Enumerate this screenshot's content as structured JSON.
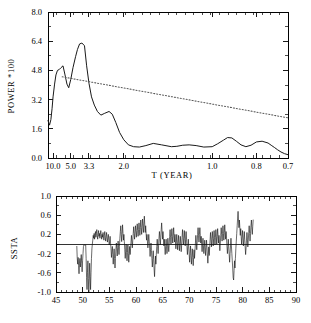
{
  "figure": {
    "caption_top_panel": "POWER *100",
    "caption_bottom_panel": "SSTA"
  },
  "chart_data": [
    {
      "type": "line",
      "title": "",
      "panel": "top",
      "xlabel": "T (YEAR)",
      "ylabel": "POWER *100",
      "xscale": "reciprocal-period",
      "xlim": [
        14.0,
        0.7
      ],
      "ylim": [
        0.0,
        8.0
      ],
      "grid": false,
      "legend": false,
      "xtick_labels": [
        "10.0",
        "5.0",
        "3.3",
        "2.0",
        "1.0",
        "0.8",
        "0.7"
      ],
      "xtick_values": [
        10.0,
        5.0,
        3.3,
        2.0,
        1.0,
        0.8,
        0.7
      ],
      "ytick_labels": [
        "0.0",
        "1.6",
        "3.2",
        "4.8",
        "6.4",
        "8.0"
      ],
      "ytick_values": [
        0.0,
        1.6,
        3.2,
        4.8,
        6.4,
        8.0
      ],
      "series": [
        {
          "name": "power spectrum",
          "style": "solid",
          "x": [
            14.0,
            12.5,
            11.4,
            10.6,
            10.0,
            9.2,
            8.6,
            8.0,
            7.4,
            6.9,
            6.4,
            6.0,
            5.6,
            5.3,
            5.0,
            4.7,
            4.4,
            4.2,
            4.0,
            3.8,
            3.6,
            3.45,
            3.3,
            3.15,
            3.0,
            2.85,
            2.7,
            2.55,
            2.4,
            2.3,
            2.2,
            2.1,
            2.0,
            1.9,
            1.8,
            1.7,
            1.6,
            1.5,
            1.4,
            1.3,
            1.25,
            1.2,
            1.15,
            1.1,
            1.05,
            1.0,
            0.97,
            0.94,
            0.92,
            0.9,
            0.88,
            0.86,
            0.84,
            0.82,
            0.8,
            0.78,
            0.76,
            0.75,
            0.74,
            0.73,
            0.72,
            0.71,
            0.7
          ],
          "y": [
            2.05,
            1.8,
            2.1,
            2.7,
            3.35,
            4.05,
            4.55,
            4.8,
            4.85,
            4.95,
            5.05,
            4.6,
            4.05,
            3.85,
            4.3,
            4.95,
            5.55,
            5.95,
            6.25,
            6.3,
            6.15,
            5.05,
            4.1,
            3.35,
            2.9,
            2.55,
            2.35,
            2.45,
            2.55,
            2.4,
            1.95,
            1.4,
            1.0,
            0.72,
            0.62,
            0.6,
            0.68,
            0.8,
            0.72,
            0.62,
            0.64,
            0.7,
            0.72,
            0.68,
            0.6,
            0.62,
            0.78,
            0.98,
            1.12,
            1.1,
            0.92,
            0.72,
            0.62,
            0.7,
            0.88,
            0.92,
            0.82,
            0.7,
            0.58,
            0.45,
            0.33,
            0.24,
            0.18
          ]
        },
        {
          "name": "red noise confidence level",
          "style": "dotted",
          "x": [
            6.6,
            0.7
          ],
          "y": [
            4.45,
            2.2
          ]
        }
      ]
    },
    {
      "type": "line",
      "title": "",
      "panel": "bottom",
      "xlabel": "",
      "ylabel": "SSTA",
      "xlim": [
        45,
        90
      ],
      "ylim": [
        -1.0,
        1.0
      ],
      "grid": false,
      "legend": false,
      "zero_reference_line": 0.0,
      "xtick_labels": [
        "45",
        "50",
        "55",
        "60",
        "65",
        "70",
        "75",
        "80",
        "85",
        "90"
      ],
      "xtick_values": [
        45,
        50,
        55,
        60,
        65,
        70,
        75,
        80,
        85,
        90
      ],
      "ytick_labels": [
        "-1.0",
        "-0.6",
        "-0.2",
        "0.2",
        "0.6",
        "1.0"
      ],
      "ytick_values": [
        -1.0,
        -0.6,
        -0.2,
        0.2,
        0.6,
        1.0
      ],
      "series": [
        {
          "name": "SSTA monthly anomaly",
          "style": "solid",
          "x_start": 48.9,
          "x_step": 0.0833,
          "y": [
            -0.05,
            -0.3,
            -0.42,
            -0.28,
            -0.45,
            -0.62,
            -0.4,
            -0.3,
            -0.48,
            -0.35,
            -0.22,
            -0.4,
            -0.58,
            -0.35,
            -0.2,
            -0.05,
            -0.02,
            -0.02,
            -0.02,
            -0.02,
            -0.02,
            -0.3,
            -0.7,
            -0.95,
            -0.6,
            -0.35,
            -0.72,
            -1.0,
            -0.75,
            -0.4,
            -0.68,
            -0.95,
            -0.6,
            -0.3,
            -0.1,
            0.0,
            0.08,
            0.18,
            0.12,
            0.22,
            0.1,
            0.18,
            0.26,
            0.14,
            0.22,
            0.3,
            0.18,
            0.1,
            0.2,
            0.28,
            0.16,
            0.22,
            0.12,
            0.2,
            0.28,
            0.18,
            0.1,
            0.2,
            0.14,
            0.24,
            0.16,
            0.08,
            0.18,
            0.26,
            0.14,
            0.06,
            0.16,
            0.24,
            0.12,
            0.04,
            0.14,
            0.2,
            0.08,
            -0.02,
            0.06,
            0.16,
            0.02,
            -0.1,
            -0.28,
            -0.15,
            -0.05,
            -0.22,
            -0.42,
            -0.25,
            -0.1,
            -0.3,
            -0.5,
            -0.3,
            -0.12,
            0.02,
            -0.1,
            -0.25,
            -0.08,
            0.06,
            -0.08,
            -0.22,
            -0.05,
            0.12,
            0.26,
            0.38,
            0.2,
            0.05,
            0.22,
            0.4,
            0.22,
            0.08,
            0.2,
            0.05,
            -0.12,
            -0.3,
            -0.15,
            0.0,
            -0.18,
            -0.35,
            -0.18,
            -0.02,
            -0.2,
            -0.38,
            -0.2,
            -0.05,
            -0.22,
            -0.1,
            0.04,
            0.18,
            0.05,
            -0.08,
            0.08,
            0.22,
            0.36,
            0.22,
            0.1,
            0.24,
            0.38,
            0.26,
            0.14,
            0.28,
            0.42,
            0.28,
            0.16,
            0.3,
            0.44,
            0.3,
            0.18,
            0.34,
            0.5,
            0.34,
            0.2,
            0.36,
            0.52,
            0.38,
            0.24,
            0.42,
            0.58,
            0.4,
            0.24,
            0.38,
            0.22,
            0.08,
            0.2,
            0.06,
            -0.08,
            0.06,
            0.2,
            0.06,
            -0.1,
            -0.26,
            -0.12,
            0.02,
            -0.14,
            -0.3,
            -0.48,
            -0.3,
            -0.14,
            -0.32,
            -0.52,
            -0.68,
            -0.45,
            -0.25,
            -0.42,
            -0.22,
            -0.05,
            0.1,
            -0.05,
            -0.2,
            -0.04,
            0.12,
            0.26,
            0.12,
            -0.02,
            0.14,
            0.3,
            0.44,
            0.26,
            0.1,
            0.26,
            0.12,
            -0.04,
            0.1,
            -0.06,
            -0.22,
            -0.06,
            0.1,
            -0.05,
            -0.2,
            -0.04,
            0.12,
            -0.02,
            -0.16,
            0.0,
            0.16,
            0.3,
            0.14,
            0.0,
            0.16,
            0.32,
            0.16,
            0.02,
            0.18,
            0.34,
            0.18,
            0.04,
            0.2,
            0.06,
            -0.1,
            0.04,
            0.2,
            0.04,
            -0.12,
            0.02,
            0.18,
            0.02,
            -0.14,
            0.0,
            0.16,
            0.0,
            -0.16,
            -0.02,
            0.14,
            0.3,
            0.14,
            -0.02,
            0.12,
            0.28,
            0.12,
            -0.04,
            0.1,
            0.26,
            0.1,
            -0.06,
            -0.22,
            -0.06,
            0.1,
            -0.06,
            -0.22,
            -0.38,
            -0.2,
            -0.04,
            -0.24,
            -0.42,
            -0.26,
            -0.1,
            -0.28,
            -0.45,
            -0.28,
            -0.12,
            -0.3,
            -0.14,
            0.02,
            0.18,
            0.04,
            -0.12,
            0.04,
            0.2,
            0.34,
            0.18,
            0.04,
            0.2,
            0.34,
            0.18,
            0.02,
            0.16,
            0.0,
            -0.16,
            -0.02,
            0.12,
            -0.04,
            -0.2,
            -0.06,
            0.08,
            -0.08,
            -0.24,
            -0.08,
            0.08,
            -0.08,
            -0.25,
            -0.4,
            -0.22,
            -0.06,
            -0.24,
            -0.08,
            0.08,
            0.24,
            0.1,
            -0.06,
            0.1,
            0.26,
            0.12,
            -0.04,
            0.12,
            0.28,
            0.14,
            -0.02,
            0.14,
            0.3,
            0.16,
            0.0,
            0.16,
            0.32,
            0.16,
            0.02,
            0.18,
            0.02,
            -0.14,
            0.02,
            0.18,
            0.34,
            0.2,
            0.06,
            0.22,
            0.38,
            0.22,
            0.08,
            0.24,
            0.4,
            0.24,
            0.1,
            0.26,
            0.12,
            -0.04,
            -0.2,
            -0.05,
            0.1,
            -0.06,
            -0.22,
            -0.38,
            -0.2,
            -0.04,
            0.12,
            -0.04,
            -0.2,
            -0.35,
            -0.52,
            -0.7,
            -0.75,
            -0.55,
            -0.35,
            -0.5,
            -0.3,
            -0.1,
            0.06,
            0.22,
            0.38,
            0.54,
            0.68,
            0.5,
            0.34,
            0.5,
            0.34,
            0.18,
            0.32,
            0.16,
            0.0,
            0.14,
            0.28,
            0.12,
            -0.04,
            0.1,
            0.26,
            0.1,
            -0.06,
            -0.22,
            -0.08,
            0.08,
            0.24,
            0.1,
            -0.06,
            0.08,
            0.24,
            0.38,
            0.22,
            0.06,
            0.22,
            0.38,
            0.5,
            0.34,
            0.2,
            0.36,
            0.5
          ]
        }
      ]
    }
  ]
}
